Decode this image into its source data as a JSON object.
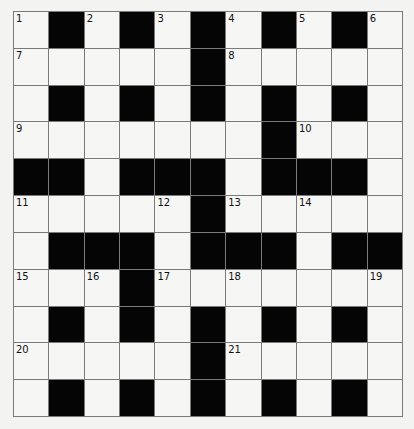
{
  "puzzle": {
    "type": "crossword",
    "rows": 11,
    "cols": 11,
    "grid": [
      "W#W#W#W#W#W",
      "WWWWW#WWWWW",
      "W#W#W#W#W#W",
      "WWWWWWW#WWW",
      "##W###W###W",
      "WWWWW#WWWWW",
      "W###W###W##",
      "WWW#WWWWWWW",
      "W#W#W#W#W#W",
      "WWWWW#WWWWW",
      "W#W#W#W#W#W"
    ],
    "numbers": [
      {
        "row": 0,
        "col": 0,
        "n": "1"
      },
      {
        "row": 0,
        "col": 2,
        "n": "2"
      },
      {
        "row": 0,
        "col": 4,
        "n": "3"
      },
      {
        "row": 0,
        "col": 6,
        "n": "4"
      },
      {
        "row": 0,
        "col": 8,
        "n": "5"
      },
      {
        "row": 0,
        "col": 10,
        "n": "6"
      },
      {
        "row": 1,
        "col": 0,
        "n": "7"
      },
      {
        "row": 1,
        "col": 6,
        "n": "8"
      },
      {
        "row": 3,
        "col": 0,
        "n": "9"
      },
      {
        "row": 3,
        "col": 8,
        "n": "10"
      },
      {
        "row": 5,
        "col": 0,
        "n": "11"
      },
      {
        "row": 5,
        "col": 4,
        "n": "12"
      },
      {
        "row": 5,
        "col": 6,
        "n": "13"
      },
      {
        "row": 5,
        "col": 8,
        "n": "14"
      },
      {
        "row": 7,
        "col": 0,
        "n": "15"
      },
      {
        "row": 7,
        "col": 2,
        "n": "16"
      },
      {
        "row": 7,
        "col": 4,
        "n": "17"
      },
      {
        "row": 7,
        "col": 6,
        "n": "18"
      },
      {
        "row": 7,
        "col": 10,
        "n": "19"
      },
      {
        "row": 9,
        "col": 0,
        "n": "20"
      },
      {
        "row": 9,
        "col": 6,
        "n": "21"
      }
    ]
  }
}
